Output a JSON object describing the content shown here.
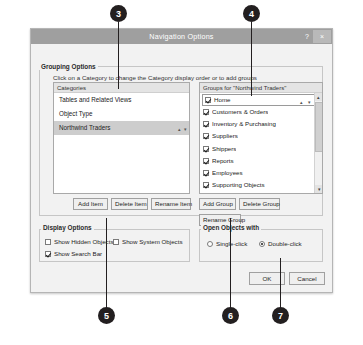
{
  "window": {
    "title": "Navigation Options",
    "help_label": "?",
    "close_label": "×"
  },
  "grouping": {
    "section_label": "Grouping Options",
    "hint": "Click on a Category to change the Category display order or to add groups",
    "categories_header": "Categories",
    "categories": [
      {
        "label": "Tables and Related Views",
        "selected": false
      },
      {
        "label": "Object Type",
        "selected": false
      },
      {
        "label": "Northwind Traders",
        "selected": true
      }
    ],
    "category_spinner": {
      "up": "▴",
      "down": "▾"
    },
    "groups_header": "Groups for \"Northwind Traders\"",
    "groups": [
      {
        "label": "Home",
        "checked": true
      },
      {
        "label": "Customers & Orders",
        "checked": true
      },
      {
        "label": "Inventory & Purchasing",
        "checked": true
      },
      {
        "label": "Suppliers",
        "checked": true
      },
      {
        "label": "Shippers",
        "checked": true
      },
      {
        "label": "Reports",
        "checked": true
      },
      {
        "label": "Employees",
        "checked": true
      },
      {
        "label": "Supporting Objects",
        "checked": true
      }
    ],
    "group_spinner": {
      "up": "▴",
      "down": "▾"
    },
    "scrollbar": {
      "up": "▴",
      "down": "▾"
    }
  },
  "buttons": {
    "add_item": "Add Item",
    "delete_item": "Delete Item",
    "rename_item": "Rename Item",
    "add_group": "Add Group",
    "delete_group": "Delete Group",
    "rename_group": "Rename Group",
    "ok": "OK",
    "cancel": "Cancel"
  },
  "display_options": {
    "section_label": "Display Options",
    "show_hidden_objects": {
      "label": "Show Hidden Objects",
      "checked": false
    },
    "show_system_objects": {
      "label": "Show System Objects",
      "checked": false
    },
    "show_search_bar": {
      "label": "Show Search Bar",
      "checked": true
    }
  },
  "open_objects": {
    "section_label": "Open Objects with",
    "single_click": {
      "label": "Single-click",
      "selected": false
    },
    "double_click": {
      "label": "Double-click",
      "selected": true
    }
  },
  "callouts": [
    {
      "number": "3"
    },
    {
      "number": "4"
    },
    {
      "number": "5"
    },
    {
      "number": "6"
    },
    {
      "number": "7"
    }
  ],
  "colors": {
    "titlebar": "#9f9f9f",
    "dialog_bg": "#f2f2f2",
    "selection": "#cdcdcd",
    "callout": "#231f20"
  }
}
